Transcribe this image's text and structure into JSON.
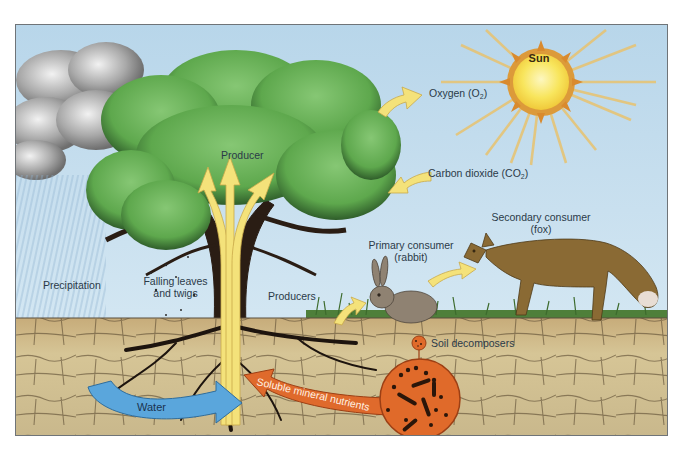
{
  "diagram": {
    "type": "ecosystem nutrient and energy cycle illustration",
    "colors": {
      "sky": "#c4dced",
      "soil": "#cdb98a",
      "tree_canopy": "#5faa4e",
      "flow_arrow_yellow": "#f4e27a",
      "water_arrow": "#5aa6dc",
      "mineral_arrow": "#df6a2c",
      "decomposer_circle": "#e06a2a",
      "sun": "#f7e055",
      "sun_rays": "#e8c77a"
    },
    "labels": {
      "sun": "Sun",
      "oxygen_prefix": "Oxygen (O",
      "oxygen_sub": "2",
      "oxygen_suffix": ")",
      "co2_prefix": "Carbon dioxide (CO",
      "co2_sub": "2",
      "co2_suffix": ")",
      "producer": "Producer",
      "precipitation": "Precipitation",
      "falling_leaves_line1": "Falling leaves",
      "falling_leaves_line2": "and twigs",
      "producers": "Producers",
      "primary_consumer_line1": "Primary consumer",
      "primary_consumer_line2": "(rabbit)",
      "secondary_consumer_line1": "Secondary consumer",
      "secondary_consumer_line2": "(fox)",
      "soil_decomposers": "Soil decomposers",
      "water": "Water",
      "soluble_mineral_nutrients": "Soluble mineral nutrients"
    },
    "elements": [
      "cloud",
      "rain",
      "tree",
      "sun",
      "rabbit",
      "fox",
      "grass",
      "soil",
      "roots",
      "decomposer-magnifier"
    ],
    "arrows": [
      {
        "from": "tree",
        "to": "atmosphere",
        "label": "Oxygen (O2)"
      },
      {
        "from": "atmosphere",
        "to": "tree",
        "label": "Carbon dioxide (CO2)"
      },
      {
        "from": "producers",
        "to": "rabbit"
      },
      {
        "from": "rabbit",
        "to": "fox"
      },
      {
        "from": "soil",
        "to": "roots",
        "label": "Water"
      },
      {
        "from": "decomposers",
        "to": "roots",
        "label": "Soluble mineral nutrients"
      },
      {
        "from": "roots",
        "to": "canopy",
        "label": "Producer (3 branches)"
      }
    ]
  }
}
